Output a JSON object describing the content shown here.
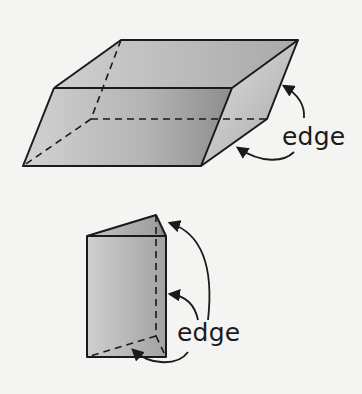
{
  "figures": [
    {
      "name": "parallelepiped",
      "label": "edge",
      "annotations": 2
    },
    {
      "name": "triangular-prism",
      "label": "edge",
      "annotations": 3
    }
  ],
  "colors": {
    "background": "#f4f4f2",
    "stroke": "#1a1a1a",
    "face_light": "#d6d6d6",
    "face_mid": "#b4b4b4",
    "face_dark": "#8e8e8e"
  }
}
